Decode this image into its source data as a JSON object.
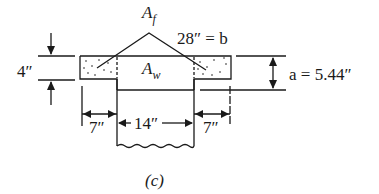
{
  "figure": {
    "caption": "(c)"
  },
  "labels": {
    "flange_area": {
      "symbol": "A",
      "subscript": "f"
    },
    "web_area": {
      "symbol": "A",
      "subscript": "w"
    },
    "effective_width": "28″ = b",
    "flange_thickness": "4″",
    "stress_block_depth": "a = 5.44″",
    "left_overhang": "7″",
    "web_width": "14″",
    "right_overhang": "7″"
  },
  "dimensions": {
    "b_in": 28,
    "hf_in": 4,
    "a_in": 5.44,
    "bw_in": 14,
    "overhang_in": 7
  },
  "colors": {
    "line": "#1a1a1a",
    "background": "#ffffff"
  }
}
